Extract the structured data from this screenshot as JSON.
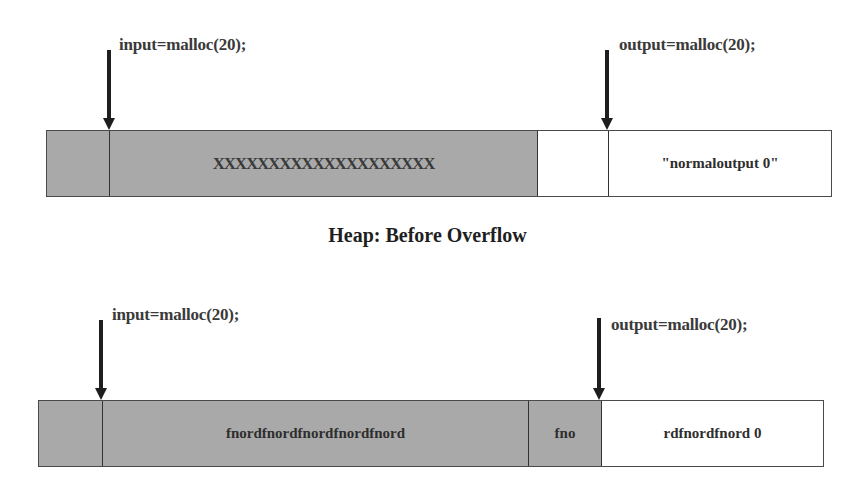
{
  "before": {
    "input_label": "input=malloc(20);",
    "output_label": "output=malloc(20);",
    "cells": {
      "header": "",
      "input_data": "XXXXXXXXXXXXXXXXXXXX",
      "gap": "",
      "output_data": "\"normaloutput  0\""
    },
    "title": "Heap: Before Overflow"
  },
  "after": {
    "input_label": "input=malloc(20);",
    "output_label": "output=malloc(20);",
    "cells": {
      "header": "",
      "input_data": "fnordfnordfnordfnordfnord",
      "overflow_gap": "fno",
      "output_data": "rdfnordfnord  0"
    }
  },
  "colors": {
    "allocated_fill": "#a9a9a9",
    "free_fill": "#ffffff",
    "arrow": "#1e1e1e",
    "border": "#4a4a4a"
  }
}
